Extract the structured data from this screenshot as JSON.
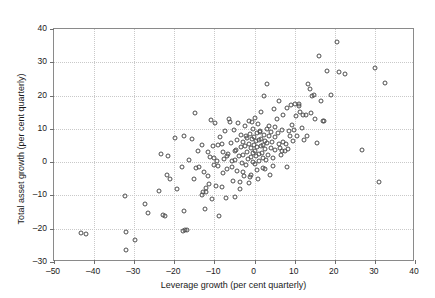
{
  "chart_data": {
    "type": "scatter",
    "title": "",
    "xlabel": "Leverage growth (per cent quarterly)",
    "ylabel": "Total asset growth (per cent quarterly)",
    "xlim": [
      -50,
      40
    ],
    "ylim": [
      -30,
      40
    ],
    "xticks": [
      -50,
      -40,
      -30,
      -20,
      -10,
      0,
      10,
      20,
      30,
      40
    ],
    "yticks": [
      -30,
      -20,
      -10,
      0,
      10,
      20,
      30,
      40
    ],
    "xtick_labels": [
      "–50",
      "–40",
      "–30",
      "–20",
      "–10",
      "0",
      "10",
      "20",
      "30",
      "40"
    ],
    "ytick_labels": [
      "–30",
      "–20",
      "–10",
      "0",
      "10",
      "20",
      "30",
      "40"
    ],
    "grid": true,
    "legend": null,
    "marker": "open-circle",
    "marker_color": "#4d4d4d",
    "points": [
      [
        -43.3,
        -21.2
      ],
      [
        -42.0,
        -21.7
      ],
      [
        -32.2,
        -10.1
      ],
      [
        -32.1,
        -20.9
      ],
      [
        -32.0,
        -26.3
      ],
      [
        -29.9,
        -23.5
      ],
      [
        -27.2,
        -12.6
      ],
      [
        -26.6,
        -15.4
      ],
      [
        -23.8,
        -8.6
      ],
      [
        -23.3,
        2.3
      ],
      [
        -22.8,
        -16.0
      ],
      [
        -22.3,
        -16.1
      ],
      [
        -21.8,
        -3.9
      ],
      [
        -21.5,
        1.9
      ],
      [
        -21.0,
        -5.1
      ],
      [
        -19.9,
        7.4
      ],
      [
        -19.4,
        -8.1
      ],
      [
        -18.2,
        -1.6
      ],
      [
        -17.7,
        7.9
      ],
      [
        -17.6,
        -14.8
      ],
      [
        -17.3,
        -20.5
      ],
      [
        -16.8,
        -20.4
      ],
      [
        -16.4,
        0.7
      ],
      [
        -15.6,
        7.1
      ],
      [
        -14.9,
        14.9
      ],
      [
        -14.5,
        -1.7
      ],
      [
        -14.2,
        3.3
      ],
      [
        -13.8,
        -1.4
      ],
      [
        -13.2,
        5.3
      ],
      [
        -12.8,
        -8.9
      ],
      [
        -12.5,
        -3.1
      ],
      [
        -12.3,
        -14.2
      ],
      [
        -12.0,
        -9.0
      ],
      [
        -11.7,
        -4.2
      ],
      [
        -11.3,
        -6.7
      ],
      [
        -11.0,
        1.6
      ],
      [
        -10.8,
        12.6
      ],
      [
        -10.6,
        -11.2
      ],
      [
        -10.4,
        4.8
      ],
      [
        -10.2,
        -0.8
      ],
      [
        -10.0,
        1.2
      ],
      [
        -9.8,
        11.9
      ],
      [
        -9.6,
        -7.3
      ],
      [
        -9.3,
        0.2
      ],
      [
        -9.0,
        -1.1
      ],
      [
        -8.8,
        -16.1
      ],
      [
        -8.5,
        7.7
      ],
      [
        -8.2,
        -7.4
      ],
      [
        -8.0,
        5.5
      ],
      [
        -7.8,
        -3.2
      ],
      [
        -7.5,
        1.0
      ],
      [
        -7.3,
        9.3
      ],
      [
        -7.0,
        -10.8
      ],
      [
        -6.8,
        -2.0
      ],
      [
        -6.5,
        2.5
      ],
      [
        -6.3,
        12.9
      ],
      [
        -6.1,
        12.0
      ],
      [
        -5.9,
        5.8
      ],
      [
        -5.7,
        -1.5
      ],
      [
        -5.5,
        0.4
      ],
      [
        -5.3,
        -5.8
      ],
      [
        -5.1,
        9.6
      ],
      [
        -4.9,
        -10.6
      ],
      [
        -4.7,
        3.6
      ],
      [
        -4.5,
        6.6
      ],
      [
        -4.3,
        -2.6
      ],
      [
        -4.1,
        11.7
      ],
      [
        -3.9,
        1.8
      ],
      [
        -3.7,
        -6.0
      ],
      [
        -3.5,
        4.4
      ],
      [
        -3.3,
        8.2
      ],
      [
        -3.1,
        -0.3
      ],
      [
        -3.0,
        6.1
      ],
      [
        -2.8,
        2.1
      ],
      [
        -2.6,
        -4.1
      ],
      [
        -2.5,
        10.8
      ],
      [
        -2.3,
        5.0
      ],
      [
        -2.1,
        -1.0
      ],
      [
        -2.0,
        7.2
      ],
      [
        -1.8,
        3.0
      ],
      [
        -1.7,
        0.9
      ],
      [
        -1.5,
        12.5
      ],
      [
        -1.4,
        5.6
      ],
      [
        -1.3,
        -6.2
      ],
      [
        -1.1,
        8.6
      ],
      [
        -1.0,
        1.4
      ],
      [
        -0.9,
        4.2
      ],
      [
        -0.8,
        -3.9
      ],
      [
        -0.6,
        6.9
      ],
      [
        -0.5,
        2.8
      ],
      [
        -0.4,
        9.9
      ],
      [
        -0.3,
        0.0
      ],
      [
        -0.2,
        5.3
      ],
      [
        -0.1,
        7.5
      ],
      [
        0.0,
        3.4
      ],
      [
        0.1,
        -0.6
      ],
      [
        0.2,
        13.2
      ],
      [
        0.3,
        6.3
      ],
      [
        0.4,
        1.9
      ],
      [
        0.5,
        8.8
      ],
      [
        0.6,
        4.6
      ],
      [
        0.7,
        -2.3
      ],
      [
        0.9,
        11.4
      ],
      [
        1.0,
        2.3
      ],
      [
        1.1,
        6.8
      ],
      [
        1.2,
        0.3
      ],
      [
        1.4,
        9.1
      ],
      [
        1.5,
        4.9
      ],
      [
        1.6,
        15.0
      ],
      [
        1.7,
        7.0
      ],
      [
        1.9,
        2.6
      ],
      [
        2.0,
        5.2
      ],
      [
        2.1,
        -1.9
      ],
      [
        2.3,
        19.8
      ],
      [
        2.4,
        8.3
      ],
      [
        2.5,
        3.8
      ],
      [
        2.7,
        6.5
      ],
      [
        2.8,
        0.6
      ],
      [
        3.0,
        23.5
      ],
      [
        3.1,
        10.1
      ],
      [
        3.2,
        5.9
      ],
      [
        3.4,
        2.2
      ],
      [
        3.6,
        7.8
      ],
      [
        3.8,
        -4.0
      ],
      [
        4.0,
        4.3
      ],
      [
        4.2,
        9.0
      ],
      [
        4.4,
        6.2
      ],
      [
        4.6,
        1.3
      ],
      [
        4.8,
        16.0
      ],
      [
        5.0,
        7.6
      ],
      [
        5.2,
        3.5
      ],
      [
        5.5,
        12.9
      ],
      [
        5.8,
        8.9
      ],
      [
        6.0,
        5.4
      ],
      [
        6.2,
        18.5
      ],
      [
        6.5,
        2.0
      ],
      [
        6.8,
        9.8
      ],
      [
        7.0,
        6.0
      ],
      [
        7.2,
        14.3
      ],
      [
        7.5,
        3.3
      ],
      [
        7.8,
        5.6
      ],
      [
        8.0,
        16.2
      ],
      [
        8.2,
        -1.5
      ],
      [
        8.5,
        9.4
      ],
      [
        8.8,
        7.9
      ],
      [
        9.0,
        17.3
      ],
      [
        9.3,
        11.2
      ],
      [
        9.6,
        6.4
      ],
      [
        10.0,
        17.6
      ],
      [
        10.3,
        13.9
      ],
      [
        10.6,
        8.0
      ],
      [
        11.0,
        17.5
      ],
      [
        11.4,
        15.2
      ],
      [
        11.8,
        10.3
      ],
      [
        12.0,
        14.1
      ],
      [
        12.4,
        6.6
      ],
      [
        12.8,
        14.2
      ],
      [
        13.0,
        7.8
      ],
      [
        13.4,
        23.4
      ],
      [
        13.8,
        22.0
      ],
      [
        14.0,
        14.8
      ],
      [
        14.4,
        19.8
      ],
      [
        14.8,
        20.2
      ],
      [
        15.0,
        12.9
      ],
      [
        15.5,
        5.7
      ],
      [
        16.0,
        32.0
      ],
      [
        16.5,
        18.3
      ],
      [
        17.0,
        12.4
      ],
      [
        17.3,
        12.4
      ],
      [
        18.0,
        27.4
      ],
      [
        19.0,
        20.3
      ],
      [
        20.5,
        36.2
      ],
      [
        21.0,
        27.1
      ],
      [
        22.5,
        26.4
      ],
      [
        26.8,
        3.5
      ],
      [
        30.0,
        28.4
      ],
      [
        31.0,
        -5.9
      ],
      [
        32.6,
        23.7
      ],
      [
        -13.0,
        -9.8
      ],
      [
        -6.9,
        1.9
      ],
      [
        -4.8,
        0.7
      ],
      [
        -2.9,
        -2.9
      ],
      [
        0.8,
        -5.0
      ],
      [
        2.2,
        1.1
      ],
      [
        5.1,
        10.5
      ],
      [
        6.4,
        4.1
      ],
      [
        8.3,
        4.0
      ],
      [
        -7.9,
        2.9
      ],
      [
        -11.5,
        3.0
      ],
      [
        -15.2,
        -5.0
      ],
      [
        -0.7,
        12.2
      ],
      [
        1.3,
        9.5
      ],
      [
        3.5,
        11.0
      ],
      [
        -2.2,
        8.0
      ],
      [
        -5.0,
        3.2
      ],
      [
        -9.2,
        5.1
      ],
      [
        -12.2,
        -7.8
      ],
      [
        2.6,
        -2.2
      ],
      [
        4.5,
        -1.3
      ],
      [
        -3.6,
        -8.2
      ],
      [
        -1.2,
        -4.4
      ],
      [
        6.9,
        3.4
      ],
      [
        9.8,
        9.6
      ],
      [
        11.2,
        16.8
      ],
      [
        -17.9,
        -20.6
      ]
    ]
  }
}
